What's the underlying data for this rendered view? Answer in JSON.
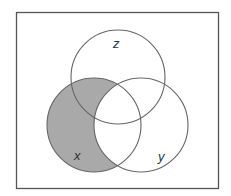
{
  "diagram": {
    "type": "venn",
    "sets": [
      {
        "name": "z",
        "label": "z",
        "cx": 118,
        "cy": 77,
        "r": 47
      },
      {
        "name": "x",
        "label": "x",
        "cx": 94,
        "cy": 125,
        "r": 47
      },
      {
        "name": "y",
        "label": "y",
        "cx": 141,
        "cy": 125,
        "r": 47
      }
    ],
    "shaded_region": "x minus y",
    "colors": {
      "border": "#555555",
      "circle_stroke": "#666666",
      "shade": "#a9a9a9",
      "background": "#ffffff"
    }
  }
}
